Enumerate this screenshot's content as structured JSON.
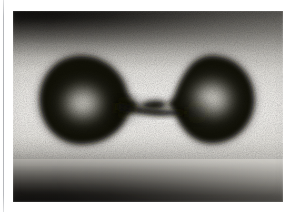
{
  "page": {
    "background_color": "#ffffff",
    "width": 304,
    "height": 212
  },
  "page_edge_rule": {
    "color": "#acaeb2",
    "orientation": "vertical"
  },
  "photograph": {
    "caption": "",
    "medium": "black-and-white photograph",
    "frame": {
      "x": 13,
      "y": 11,
      "width": 270,
      "height": 191
    },
    "background_description": "backlit field with dark horizontal bands across the top and bottom that are darkest at the left edge and fade toward the right, and a bright luminous band through the middle",
    "colors": {
      "band_dark": "#0a0908",
      "field_mid": "#f0eeea",
      "field_base": "#e9e8e4",
      "subject_dark": "#17150f",
      "subject_highlight": "#f2f0ea"
    },
    "subject": {
      "name": "liquid droplet",
      "shape": "dumbbell",
      "description": "two rounded lobes of nearly equal size joined by a slender pinched neck, photographed in silhouette against a backlit field",
      "lobe_left": {
        "cx": 68,
        "cy": 89,
        "rx": 42,
        "ry": 45
      },
      "lobe_right": {
        "cx": 198,
        "cy": 88,
        "rx": 41,
        "ry": 44
      },
      "neck": {
        "cx": 133,
        "cy": 96,
        "half_height": 5
      }
    }
  }
}
